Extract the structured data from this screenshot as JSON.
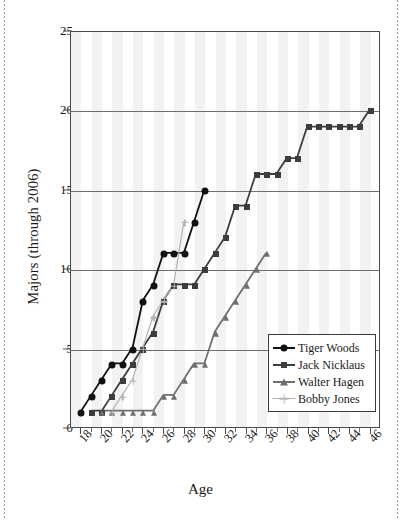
{
  "chart_data": {
    "type": "line",
    "title": "",
    "xlabel": "Age",
    "ylabel": "Majors (through 2006)",
    "xlim": [
      17,
      47
    ],
    "ylim": [
      0,
      25
    ],
    "xticks": [
      18,
      20,
      22,
      24,
      26,
      28,
      30,
      32,
      34,
      36,
      38,
      40,
      42,
      44,
      46
    ],
    "yticks": [
      0,
      5,
      10,
      15,
      20,
      25
    ],
    "grid": "horizontal",
    "legend_position": "lower-right",
    "background_bands": "alternating vertical grey stripes",
    "series": [
      {
        "name": "Tiger Woods",
        "color": "#111111",
        "marker": "circle",
        "x": [
          18,
          19,
          20,
          21,
          22,
          23,
          24,
          25,
          26,
          27,
          28,
          29,
          30
        ],
        "y": [
          1,
          2,
          3,
          4,
          4,
          5,
          8,
          9,
          11,
          11,
          11,
          13,
          15
        ]
      },
      {
        "name": "Jack Nicklaus",
        "color": "#3d3d3d",
        "marker": "square",
        "x": [
          19,
          20,
          21,
          22,
          23,
          24,
          25,
          26,
          27,
          28,
          29,
          30,
          31,
          32,
          33,
          34,
          35,
          36,
          37,
          38,
          39,
          40,
          41,
          42,
          43,
          44,
          45,
          46
        ],
        "y": [
          1,
          1,
          2,
          3,
          4,
          5,
          6,
          8,
          9,
          9,
          9,
          10,
          11,
          12,
          14,
          14,
          16,
          16,
          16,
          17,
          17,
          19,
          19,
          19,
          19,
          19,
          19,
          20
        ]
      },
      {
        "name": "Walter Hagen",
        "color": "#6f6f6f",
        "marker": "triangle",
        "x": [
          20,
          21,
          22,
          23,
          24,
          25,
          26,
          27,
          28,
          29,
          30,
          31,
          32,
          33,
          34,
          35,
          36
        ],
        "y": [
          1,
          1,
          1,
          1,
          1,
          1,
          2,
          2,
          3,
          4,
          4,
          6,
          7,
          8,
          9,
          10,
          11
        ]
      },
      {
        "name": "Bobby Jones",
        "color": "#b4b4b4",
        "marker": "plus",
        "x": [
          21,
          22,
          23,
          24,
          25,
          26,
          27,
          28
        ],
        "y": [
          1,
          2,
          3,
          5,
          7,
          8,
          9,
          13
        ]
      }
    ]
  },
  "legend": {
    "items": [
      {
        "label": "Tiger Woods",
        "color": "#111111",
        "marker": "circle"
      },
      {
        "label": "Jack Nicklaus",
        "color": "#3d3d3d",
        "marker": "square"
      },
      {
        "label": "Walter Hagen",
        "color": "#6f6f6f",
        "marker": "triangle"
      },
      {
        "label": "Bobby Jones",
        "color": "#b4b4b4",
        "marker": "plus"
      }
    ]
  }
}
